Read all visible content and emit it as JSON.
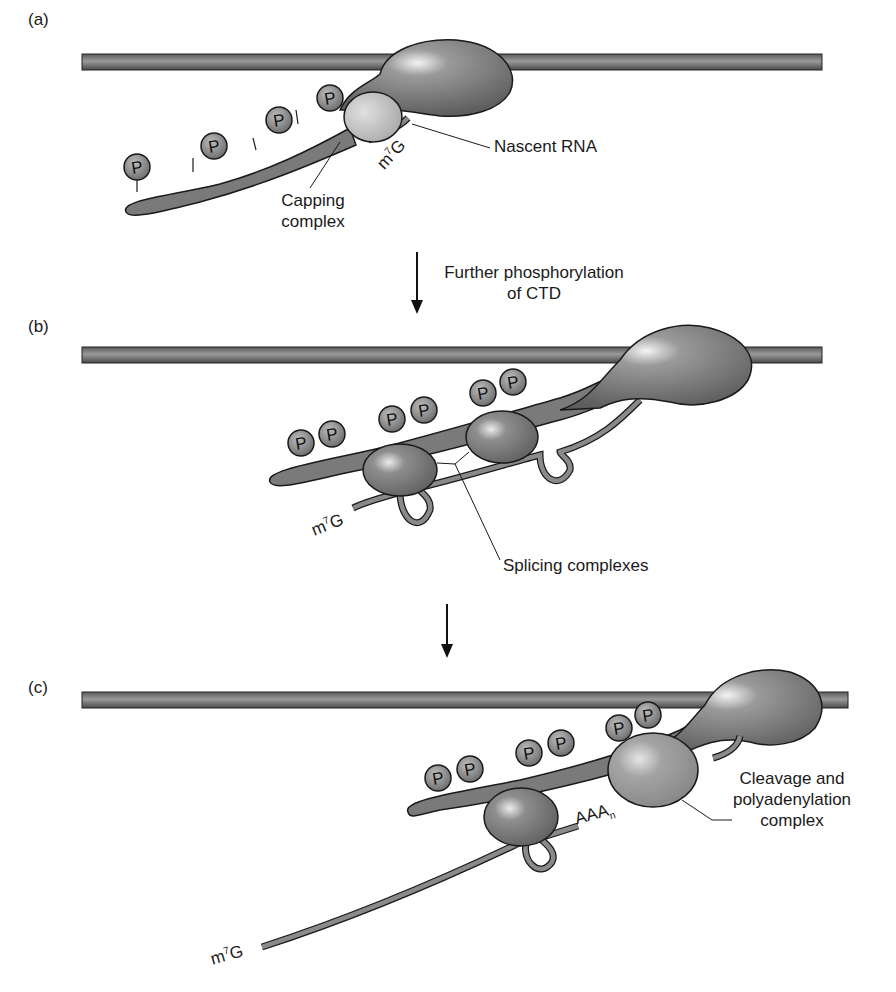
{
  "panels": [
    {
      "id": "a",
      "label": "(a)",
      "labels": {
        "nascent_rna": "Nascent RNA",
        "capping_complex_line1": "Capping",
        "capping_complex_line2": "complex",
        "cap": "m",
        "cap_sup": "7",
        "cap_tail": "G"
      },
      "phospho_count": 4
    },
    {
      "id": "b",
      "label": "(b)",
      "labels": {
        "splicing_complexes": "Splicing complexes",
        "cap": "m",
        "cap_sup": "7",
        "cap_tail": "G"
      },
      "phospho_count": 6
    },
    {
      "id": "c",
      "label": "(c)",
      "labels": {
        "cleavage_line1": "Cleavage and",
        "cleavage_line2": "polyadenylation",
        "cleavage_line3": "complex",
        "polya": "AAA",
        "polya_sub": "n",
        "cap": "m",
        "cap_sup": "7",
        "cap_tail": "G"
      },
      "phospho_count": 6
    }
  ],
  "transitions": [
    {
      "from": "a",
      "to": "b",
      "line1": "Further phosphorylation",
      "line2": "of CTD"
    },
    {
      "from": "b",
      "to": "c",
      "line1": "",
      "line2": ""
    }
  ],
  "phosphate_glyph": "P",
  "colors": {
    "dna": "#7a7a7a",
    "polymerase": "#6e6e6e",
    "capping": "#b8b8b8",
    "rna": "#8a8a8a",
    "outline": "#1a1a1a"
  }
}
